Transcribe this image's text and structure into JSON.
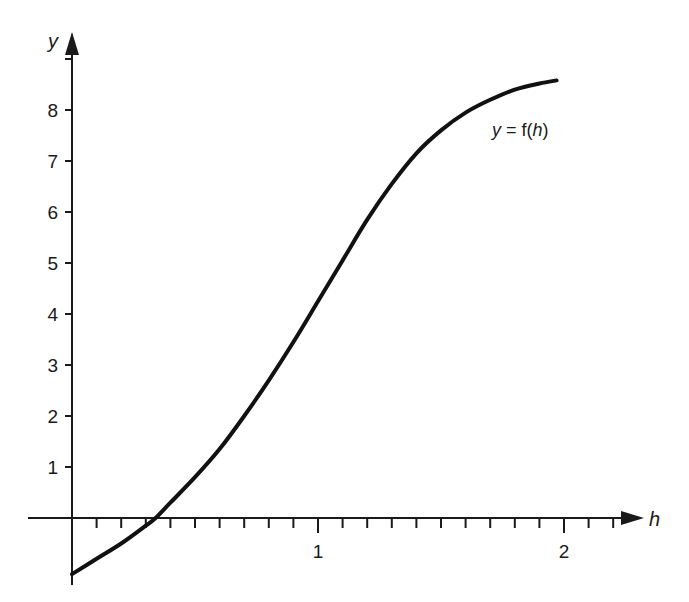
{
  "chart_data": {
    "type": "line",
    "title": "",
    "xlabel": "h",
    "ylabel": "y",
    "xlim": [
      -0.18,
      2.4
    ],
    "ylim": [
      -1.3,
      9.3
    ],
    "grid": false,
    "legend": null,
    "x_tick_labels": [
      "1",
      "2"
    ],
    "x_major_ticks": [
      1,
      2
    ],
    "x_minor_tick_step": 0.1,
    "y_tick_labels": [
      "1",
      "2",
      "3",
      "4",
      "5",
      "6",
      "7",
      "8"
    ],
    "y_ticks": [
      1,
      2,
      3,
      4,
      5,
      6,
      7,
      8,
      9
    ],
    "annotations": [
      {
        "text": "y = f(h)",
        "x": 1.8,
        "y": 7.2
      }
    ],
    "series": [
      {
        "name": "y = f(h)",
        "x": [
          0.0,
          0.1,
          0.2,
          0.3,
          0.34,
          0.4,
          0.5,
          0.6,
          0.7,
          0.8,
          0.9,
          1.0,
          1.1,
          1.2,
          1.3,
          1.4,
          1.5,
          1.6,
          1.7,
          1.8,
          1.9,
          1.97
        ],
        "values": [
          -1.1,
          -0.8,
          -0.5,
          -0.15,
          0.0,
          0.3,
          0.8,
          1.35,
          2.0,
          2.7,
          3.45,
          4.25,
          5.05,
          5.85,
          6.55,
          7.15,
          7.6,
          7.95,
          8.2,
          8.4,
          8.52,
          8.58
        ]
      }
    ]
  },
  "labels": {
    "y_axis": "y",
    "x_axis": "h",
    "curve": "y = f(h)",
    "curve_y": "y",
    "curve_eq": " = f(",
    "curve_h": "h",
    "curve_close": ")"
  }
}
